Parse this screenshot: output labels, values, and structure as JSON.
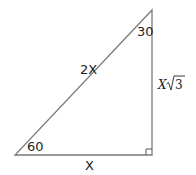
{
  "diagram": {
    "type": "right-triangle-30-60-90",
    "vertices": {
      "top": [
        152,
        10
      ],
      "bottom_left": [
        15,
        155
      ],
      "bottom_right": [
        152,
        155
      ]
    },
    "angles": {
      "top": "30",
      "bottom_left": "60"
    },
    "sides": {
      "hypotenuse": "2X",
      "base": "X",
      "vertical_var": "X",
      "vertical_radicand": "3"
    },
    "right_angle_marker": true,
    "colors": {
      "line": "#7a7a7a",
      "text": "#222222"
    }
  }
}
